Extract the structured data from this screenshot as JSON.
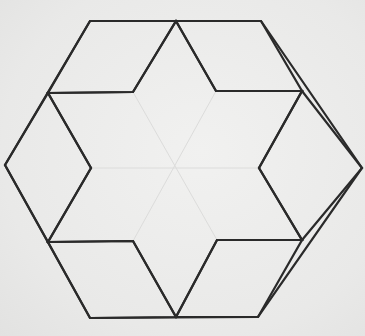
{
  "diagram": {
    "title": "",
    "colors": {
      "background": "#ebebea",
      "line": "#2a2a2a",
      "faint_line": "#dcdcdb"
    },
    "outer_hexagon": [
      [
        90,
        21
      ],
      [
        261,
        21
      ],
      [
        362,
        168
      ],
      [
        258,
        317
      ],
      [
        90,
        318
      ],
      [
        5,
        165
      ]
    ],
    "star_outline": [
      [
        176,
        21
      ],
      [
        216,
        91
      ],
      [
        302,
        91
      ],
      [
        259,
        168
      ],
      [
        302,
        240
      ],
      [
        217,
        240
      ],
      [
        176,
        317
      ],
      [
        133,
        241
      ],
      [
        48,
        242
      ],
      [
        91,
        168
      ],
      [
        48,
        93
      ],
      [
        133,
        92
      ]
    ],
    "rhombi": [
      {
        "name": "top-left",
        "points": [
          [
            90,
            21
          ],
          [
            176,
            21
          ],
          [
            133,
            92
          ],
          [
            48,
            93
          ]
        ]
      },
      {
        "name": "top-right",
        "points": [
          [
            176,
            21
          ],
          [
            261,
            21
          ],
          [
            302,
            91
          ],
          [
            216,
            91
          ]
        ]
      },
      {
        "name": "right",
        "points": [
          [
            302,
            91
          ],
          [
            362,
            168
          ],
          [
            302,
            240
          ],
          [
            259,
            168
          ]
        ]
      },
      {
        "name": "bottom-right",
        "points": [
          [
            217,
            240
          ],
          [
            302,
            240
          ],
          [
            258,
            317
          ],
          [
            176,
            317
          ]
        ]
      },
      {
        "name": "bottom-left",
        "points": [
          [
            48,
            242
          ],
          [
            133,
            241
          ],
          [
            176,
            317
          ],
          [
            90,
            318
          ]
        ]
      },
      {
        "name": "left",
        "points": [
          [
            5,
            165
          ],
          [
            48,
            93
          ],
          [
            91,
            168
          ],
          [
            48,
            242
          ]
        ]
      }
    ],
    "faint_inner_lines": [
      [
        [
          133,
          92
        ],
        [
          217,
          240
        ]
      ],
      [
        [
          216,
          91
        ],
        [
          133,
          241
        ]
      ],
      [
        [
          91,
          168
        ],
        [
          259,
          168
        ]
      ]
    ]
  }
}
